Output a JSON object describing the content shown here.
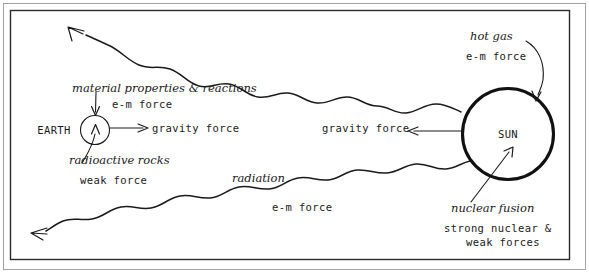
{
  "diagram": {
    "bodies": {
      "earth": {
        "label": "EARTH"
      },
      "sun": {
        "label": "SUN"
      }
    },
    "annotations": {
      "material_properties": "material properties & reactions",
      "material_properties_force": "e-m force",
      "radioactive_rocks": "radioactive rocks",
      "radioactive_rocks_force": "weak force",
      "gravity_force_earth": "gravity force",
      "gravity_force_sun": "gravity force",
      "hot_gas": "hot gas",
      "hot_gas_force": "e-m force",
      "radiation": "radiation",
      "radiation_force": "e-m force",
      "nuclear_fusion": "nuclear fusion",
      "nuclear_fusion_force_line1": "strong nuclear &",
      "nuclear_fusion_force_line2": "weak forces"
    },
    "colors": {
      "ink": "#1a1a1a",
      "frame": "#2b2b2b",
      "frame_inner": "#8d8d8d",
      "background": "#ffffff"
    }
  }
}
